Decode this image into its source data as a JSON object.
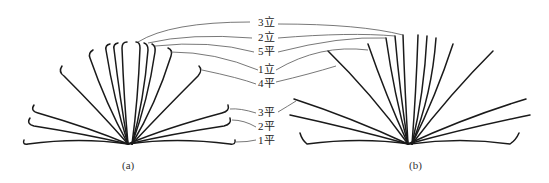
{
  "figure": {
    "labels": [
      {
        "id": "3li",
        "text": "3立",
        "x": 262,
        "y": 19
      },
      {
        "id": "2li",
        "text": "2立",
        "x": 262,
        "y": 33
      },
      {
        "id": "5ping",
        "text": "5平",
        "x": 262,
        "y": 47
      },
      {
        "id": "1li",
        "text": "1立",
        "x": 262,
        "y": 66
      },
      {
        "id": "4ping",
        "text": "4平",
        "x": 262,
        "y": 79
      },
      {
        "id": "3ping",
        "text": "3平",
        "x": 262,
        "y": 109
      },
      {
        "id": "2ping",
        "text": "2平",
        "x": 262,
        "y": 123
      },
      {
        "id": "1ping",
        "text": "1平",
        "x": 262,
        "y": 136
      }
    ],
    "captions": {
      "a": "(a)",
      "b": "(b)"
    },
    "colors": {
      "strip": "#1a1a1a",
      "leader": "#555555",
      "background": "#ffffff"
    }
  }
}
